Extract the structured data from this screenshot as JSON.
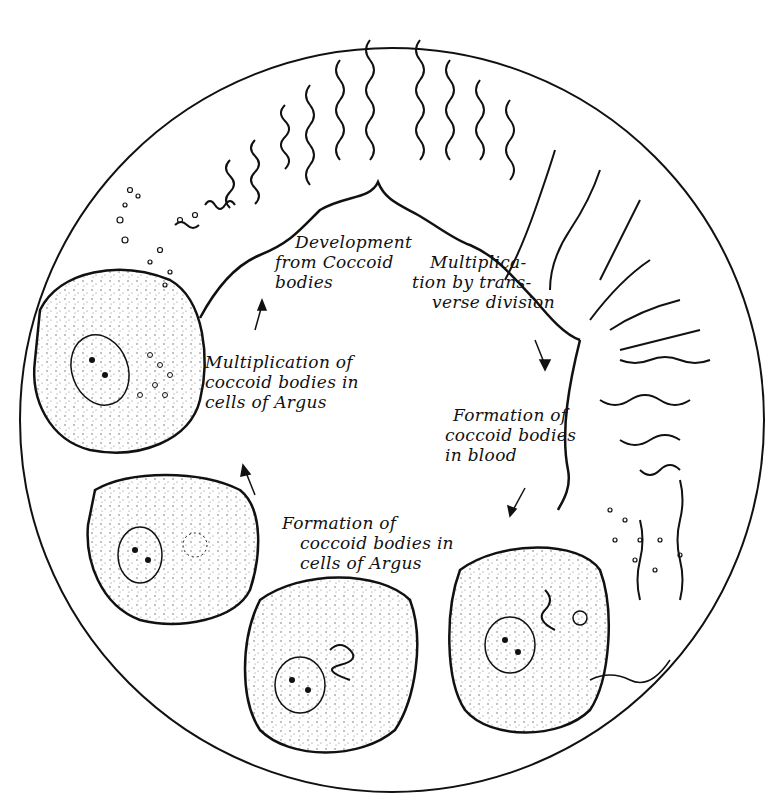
{
  "diagram": {
    "type": "life-cycle illustration",
    "labels": {
      "development": [
        "Development",
        "from Coccoid",
        "bodies"
      ],
      "transverse": [
        "Multiplica-",
        "tion by trans-",
        "verse division"
      ],
      "multiplication_argus": [
        "Multiplication of",
        "coccoid bodies in",
        "cells of Argus"
      ],
      "formation_blood": [
        "Formation of",
        "coccoid bodies",
        "in blood"
      ],
      "formation_argus": [
        "Formation of",
        "coccoid bodies in",
        "cells of Argus"
      ]
    },
    "colors": {
      "ink": "#111111",
      "background": "#ffffff",
      "cell_fill": "#f4f4f4"
    }
  }
}
